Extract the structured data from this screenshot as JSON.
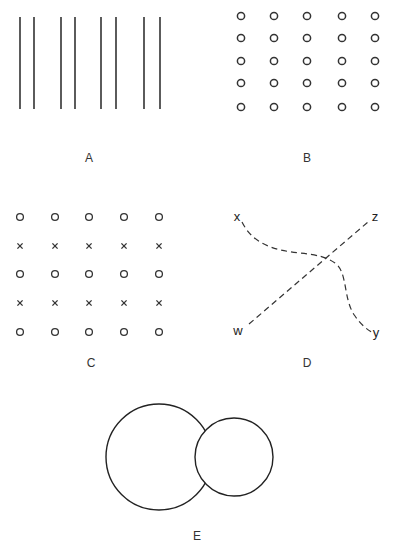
{
  "panels": {
    "A": {
      "label": "A",
      "lines_x": [
        20,
        34,
        61,
        75,
        101,
        116,
        144,
        160
      ],
      "y1": 17,
      "y2": 109
    },
    "B": {
      "label": "B",
      "cols": [
        241,
        274,
        307,
        342,
        375
      ],
      "rows": [
        16,
        38,
        61,
        83,
        107
      ],
      "symbol": "o"
    },
    "C": {
      "label": "C",
      "cols": [
        20,
        55,
        89,
        124,
        159
      ],
      "rows": [
        217,
        246,
        274,
        303,
        332
      ],
      "row_symbols": [
        "o",
        "x",
        "o",
        "x",
        "o"
      ]
    },
    "D": {
      "label": "D",
      "point_labels": {
        "x": "x",
        "z": "z",
        "w": "w",
        "y": "y"
      }
    },
    "E": {
      "label": "E",
      "large_circle": {
        "cx": 159,
        "cy": 457,
        "r": 53
      },
      "small_circle": {
        "cx": 234,
        "cy": 457,
        "r": 39
      }
    }
  }
}
